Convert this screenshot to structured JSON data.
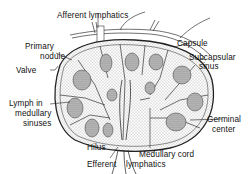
{
  "diagram": {
    "colors": {
      "ink": "#222222",
      "background": "#ffffff",
      "fill": "#d8d8d8"
    },
    "labels": {
      "afferent_lymphatics": "Afferent lymphatics",
      "capsule": "Capsule",
      "subcapsular_sinus_1": "Subcapsular",
      "subcapsular_sinus_2": "sinus",
      "primary_nodule_1": "Primary",
      "primary_nodule_2": "nodule",
      "valve": "Valve",
      "lymph_medullary_1": "Lymph in",
      "lymph_medullary_2": "medullary",
      "lymph_medullary_3": "sinuses",
      "germinal_center_1": "Germinal",
      "germinal_center_2": "center",
      "hilus": "Hilus",
      "medullary_cord": "Medullary cord",
      "efferent_lymphatics_1": "Efferent",
      "efferent_lymphatics_2": "lymphatics"
    }
  }
}
